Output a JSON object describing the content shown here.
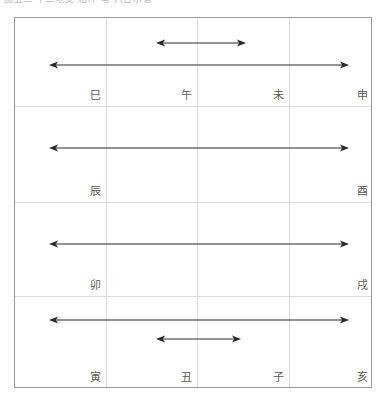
{
  "caption": {
    "fragment": "图五二  十二地支  相冲  与  六合示意"
  },
  "diagram": {
    "frame": {
      "x": 14,
      "y": 17,
      "width": 358,
      "height": 371,
      "border_color": "#9a9a9a",
      "grid_color": "#dcdcdc",
      "background": "#ffffff"
    },
    "columns": 4,
    "rows": 4,
    "vertical_gridlines_x": [
      91,
      182,
      274
    ],
    "horizontal_gridlines_y": [
      88,
      184,
      278
    ],
    "label_color": "#5a5a5a",
    "arrow_color": "#2a2a2a"
  },
  "cells": [
    {
      "row": 1,
      "col": 1,
      "label": "巳",
      "x": 86,
      "y": 83
    },
    {
      "row": 1,
      "col": 2,
      "label": "午",
      "x": 177,
      "y": 83
    },
    {
      "row": 1,
      "col": 3,
      "label": "未",
      "x": 269,
      "y": 83
    },
    {
      "row": 1,
      "col": 4,
      "label": "申",
      "x": 353,
      "y": 83
    },
    {
      "row": 2,
      "col": 1,
      "label": "辰",
      "x": 86,
      "y": 179
    },
    {
      "row": 2,
      "col": 2,
      "label": "",
      "x": 177,
      "y": 179
    },
    {
      "row": 2,
      "col": 3,
      "label": "",
      "x": 269,
      "y": 179
    },
    {
      "row": 2,
      "col": 4,
      "label": "酉",
      "x": 353,
      "y": 179
    },
    {
      "row": 3,
      "col": 1,
      "label": "卯",
      "x": 86,
      "y": 273
    },
    {
      "row": 3,
      "col": 2,
      "label": "",
      "x": 177,
      "y": 273
    },
    {
      "row": 3,
      "col": 3,
      "label": "",
      "x": 269,
      "y": 273
    },
    {
      "row": 3,
      "col": 4,
      "label": "戌",
      "x": 353,
      "y": 273
    },
    {
      "row": 4,
      "col": 1,
      "label": "寅",
      "x": 86,
      "y": 365
    },
    {
      "row": 4,
      "col": 2,
      "label": "丑",
      "x": 177,
      "y": 365
    },
    {
      "row": 4,
      "col": 3,
      "label": "子",
      "x": 269,
      "y": 365
    },
    {
      "row": 4,
      "col": 4,
      "label": "亥",
      "x": 353,
      "y": 365
    }
  ],
  "arrows": [
    {
      "name": "arrow-row1-short",
      "row": 1,
      "x1": 141,
      "x2": 231,
      "y": 25,
      "span": "午 ↔ 未"
    },
    {
      "name": "arrow-row1-long",
      "row": 1,
      "x1": 34,
      "x2": 334,
      "y": 47,
      "span": "巳 ↔ 申"
    },
    {
      "name": "arrow-row2-long",
      "row": 2,
      "x1": 34,
      "x2": 334,
      "y": 130,
      "span": "辰 ↔ 酉"
    },
    {
      "name": "arrow-row3-long",
      "row": 3,
      "x1": 34,
      "x2": 334,
      "y": 226,
      "span": "卯 ↔ 戌"
    },
    {
      "name": "arrow-row4-long",
      "row": 4,
      "x1": 34,
      "x2": 334,
      "y": 302,
      "span": "寅 ↔ 亥"
    },
    {
      "name": "arrow-row4-short",
      "row": 4,
      "x1": 141,
      "x2": 226,
      "y": 321,
      "span": "丑 ↔ 子"
    }
  ]
}
